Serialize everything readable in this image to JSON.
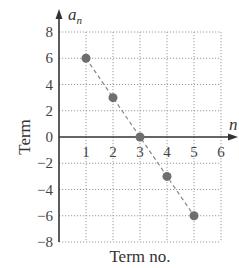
{
  "chart_data": {
    "type": "scatter",
    "title": "",
    "xlabel": "Term no.",
    "ylabel": "Term",
    "x_axis_symbol": "n",
    "y_axis_symbol": "a",
    "y_axis_symbol_sub": "n",
    "xlim": [
      0,
      6
    ],
    "ylim": [
      -8,
      8
    ],
    "x_ticks": [
      "1",
      "2",
      "3",
      "4",
      "5",
      "6"
    ],
    "y_ticks": [
      "8",
      "6",
      "4",
      "2",
      "0",
      "−2",
      "−4",
      "−6",
      "−8"
    ],
    "grid": true,
    "grid_style": "dotted",
    "series": [
      {
        "name": "a_n",
        "x": [
          1,
          2,
          3,
          4,
          5
        ],
        "y": [
          6,
          3,
          0,
          -3,
          -6
        ],
        "marker_color": "#6e6e6e",
        "trend_line": "dashed"
      }
    ]
  },
  "colors": {
    "axis": "#333333",
    "grid": "#9a9a9a",
    "points": "#6e6e6e"
  }
}
